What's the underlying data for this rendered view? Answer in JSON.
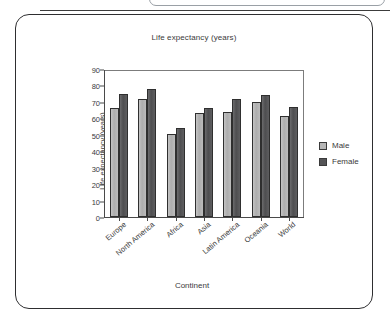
{
  "chart_data": {
    "type": "bar",
    "title": "Life expectancy (years)",
    "xlabel": "Continent",
    "ylabel": "Life expectancy (years)",
    "ylim": [
      0,
      90
    ],
    "yticks": [
      90,
      80,
      70,
      60,
      50,
      40,
      30,
      20,
      10,
      0
    ],
    "grid": false,
    "legend_position": "right",
    "categories": [
      "Europe",
      "North America",
      "Africa",
      "Asia",
      "Latin America",
      "Oceania",
      "World"
    ],
    "series": [
      {
        "name": "Male",
        "color": "#b6b6b6",
        "values": [
          67,
          73,
          51,
          64,
          65,
          71,
          62
        ]
      },
      {
        "name": "Female",
        "color": "#545456",
        "values": [
          76,
          79,
          55,
          67,
          73,
          75,
          68
        ]
      }
    ]
  },
  "legend": {
    "items": [
      {
        "label": "Male"
      },
      {
        "label": "Female"
      }
    ]
  }
}
